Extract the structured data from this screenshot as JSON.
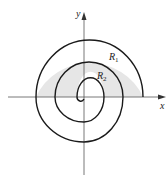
{
  "diagram": {
    "type": "polar spiral with shaded regions",
    "axes": {
      "x_label": "x",
      "y_label": "y"
    },
    "regions": [
      {
        "name": "R",
        "subscript": "1",
        "description": "shaded region between outer and middle turns, upper half-plane"
      },
      {
        "name": "R",
        "subscript": "2",
        "description": "shaded region between middle and inner turns, upper half-plane"
      }
    ],
    "colors": {
      "curve": "#1a1a1a",
      "shade": "#e6e6e6",
      "axis": "#555555"
    }
  }
}
